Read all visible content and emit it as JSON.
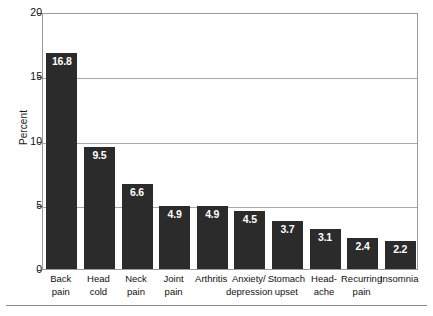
{
  "chart_data": {
    "type": "bar",
    "title": "",
    "subtitle": "",
    "xlabel": "",
    "ylabel": "Percent",
    "ylim": [
      0,
      20
    ],
    "yticks": [
      0,
      5,
      10,
      15,
      20
    ],
    "ytick_labels": [
      "0",
      "5",
      "10",
      "15",
      "20"
    ],
    "grid": "horizontal",
    "gridlines_at": [
      5,
      10,
      15
    ],
    "legend": "none",
    "bar_color": "#2b2b2b",
    "value_label_color": "#ffffff",
    "categories": [
      "Back pain",
      "Head cold",
      "Neck pain",
      "Joint pain",
      "Arthritis",
      "Anxiety/ depression",
      "Stomach upset",
      "Head- ache",
      "Recurring pain",
      "Insomnia"
    ],
    "category_lines": [
      [
        "Back",
        "pain"
      ],
      [
        "Head",
        "cold"
      ],
      [
        "Neck",
        "pain"
      ],
      [
        "Joint",
        "pain"
      ],
      [
        "Arthritis",
        ""
      ],
      [
        "Anxiety/",
        "depression"
      ],
      [
        "Stomach",
        "upset"
      ],
      [
        "Head-",
        "ache"
      ],
      [
        "Recurring",
        "pain"
      ],
      [
        "Insomnia",
        ""
      ]
    ],
    "values": [
      16.8,
      9.5,
      6.6,
      4.9,
      4.9,
      4.5,
      3.7,
      3.1,
      2.4,
      2.2
    ],
    "value_labels": [
      "16.8",
      "9.5",
      "6.6",
      "4.9",
      "4.9",
      "4.5",
      "3.7",
      "3.1",
      "2.4",
      "2.2"
    ]
  }
}
